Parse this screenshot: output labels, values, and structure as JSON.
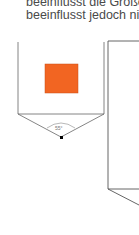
{
  "text": {
    "line1": "beeinflusst die Größe",
    "line2": "beeinflusst jedoch nich"
  },
  "diagram": {
    "angle_label": "55°",
    "square_color": "#f26522",
    "line_color": "#666666"
  }
}
